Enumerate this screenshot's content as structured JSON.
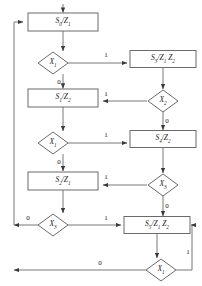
{
  "diagram": {
    "type": "state-machine-flowchart",
    "title": "",
    "stroke_color": "#4d4d4d",
    "text_color": "#1a1a1a",
    "background": "#ffffff",
    "state_boxes": [
      {
        "id": "S0",
        "label": "S0/Z1",
        "text": "S",
        "sub": "0",
        "out": "/Z",
        "out_sub": "1",
        "x": 63,
        "y": 22,
        "w": 70,
        "h": 18
      },
      {
        "id": "S3",
        "label": "S3/Z1 Z2",
        "x": 163,
        "y": 59,
        "w": 66,
        "h": 17
      },
      {
        "id": "S1",
        "label": "S1/Z2",
        "x": 63,
        "y": 98,
        "w": 70,
        "h": 18
      },
      {
        "id": "S4",
        "label": "S4/Z2",
        "x": 163,
        "y": 139,
        "w": 66,
        "h": 17
      },
      {
        "id": "S2",
        "label": "S2/Z1",
        "x": 63,
        "y": 181,
        "w": 70,
        "h": 18
      },
      {
        "id": "S5",
        "label": "S5/Z1 Z2",
        "x": 157,
        "y": 225,
        "w": 66,
        "h": 17
      }
    ],
    "decision_nodes": [
      {
        "id": "D1",
        "label": "X1",
        "x": 53,
        "y": 63,
        "w": 30,
        "h": 22
      },
      {
        "id": "D2",
        "label": "X2",
        "x": 157,
        "y": 101,
        "w": 30,
        "h": 22
      },
      {
        "id": "D3",
        "label": "X1",
        "x": 53,
        "y": 143,
        "w": 30,
        "h": 22
      },
      {
        "id": "D4",
        "label": "X3",
        "x": 157,
        "y": 185,
        "w": 30,
        "h": 22
      },
      {
        "id": "D5",
        "label": "X3",
        "x": 53,
        "y": 225,
        "w": 30,
        "h": 22
      },
      {
        "id": "D6",
        "label": "X1",
        "x": 161,
        "y": 270,
        "w": 30,
        "h": 22
      }
    ],
    "edge_labels": [
      {
        "value": "1",
        "x": 106,
        "y": 55,
        "from": "D1",
        "to": "S3"
      },
      {
        "value": "0",
        "x": 59,
        "y": 82,
        "from": "D1",
        "to": "S1"
      },
      {
        "value": "1",
        "x": 106,
        "y": 94,
        "from": "D2",
        "to": "S1"
      },
      {
        "value": "0",
        "x": 164,
        "y": 121,
        "from": "D2",
        "to": "S4"
      },
      {
        "value": "1",
        "x": 106,
        "y": 135,
        "from": "D3",
        "to": "S4"
      },
      {
        "value": "0",
        "x": 59,
        "y": 162,
        "from": "D3",
        "to": "S2"
      },
      {
        "value": "1",
        "x": 106,
        "y": 177,
        "from": "D4",
        "to": "S2"
      },
      {
        "value": "0",
        "x": 164,
        "y": 206,
        "from": "D4",
        "to": "S5"
      },
      {
        "value": "0",
        "x": 28,
        "y": 219,
        "from": "D5",
        "to": "S0"
      },
      {
        "value": "1",
        "x": 106,
        "y": 219,
        "from": "D5",
        "to": "S5"
      },
      {
        "value": "1",
        "x": 190,
        "y": 252,
        "from": "D6",
        "to": "S5"
      },
      {
        "value": "0",
        "x": 100,
        "y": 263,
        "from": "D6",
        "to": "S0"
      }
    ],
    "states": [
      "S0",
      "S1",
      "S2",
      "S3",
      "S4",
      "S5"
    ],
    "outputs": [
      "Z1",
      "Z2"
    ],
    "inputs": [
      "X1",
      "X2",
      "X3"
    ]
  }
}
